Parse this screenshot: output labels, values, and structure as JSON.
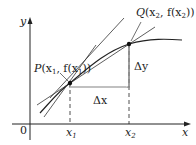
{
  "diagram": {
    "axes": {
      "x_label": "x",
      "y_label": "y",
      "origin_label": "0"
    },
    "points": [
      {
        "id": "P",
        "label": "P(x₁, f(x₁))",
        "name": "P",
        "args": "(x",
        "sub": "1",
        "mid": ", f(x",
        "sub2": "1",
        "end": "))"
      },
      {
        "id": "Q",
        "label": "Q(x₂, f(x₂))",
        "name": "Q",
        "args": "(x",
        "sub": "2",
        "mid": ", f(x",
        "sub2": "2",
        "end": "))"
      }
    ],
    "ticks": [
      {
        "label": "x",
        "sub": "1"
      },
      {
        "label": "x",
        "sub": "2"
      }
    ],
    "increments": {
      "dx": "Δx",
      "dy": "Δy"
    },
    "colors": {
      "stroke": "#222222",
      "background": "#ffffff"
    }
  }
}
